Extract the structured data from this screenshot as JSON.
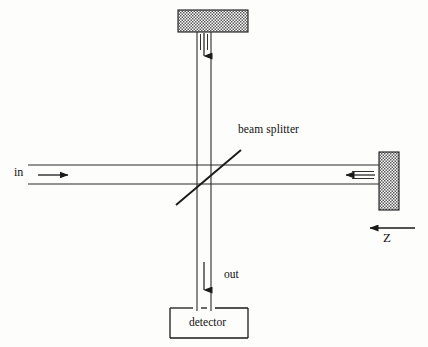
{
  "figure": {
    "background_color": "#fdfdfc",
    "ink_color": "#1a1a1a"
  },
  "labels": {
    "beam_splitter": "beam splitter",
    "input": "in",
    "output": "out",
    "detector": "detector",
    "translation_axis": "Z"
  },
  "components": {
    "top_mirror": {
      "name": "top mirror",
      "fill": "hatch-checker",
      "x": 178,
      "y": 10,
      "width": 70,
      "height": 22
    },
    "right_mirror": {
      "name": "right mirror",
      "fill": "hatch-checker",
      "x": 379,
      "y": 152,
      "width": 20,
      "height": 58
    },
    "beam_splitter_line": {
      "name": "beam splitter",
      "x1": 176,
      "y1": 205,
      "x2": 241,
      "y2": 150
    },
    "detector_box": {
      "name": "detector",
      "x": 170,
      "y": 308,
      "width": 78,
      "height": 30
    }
  },
  "beams": {
    "vertical_left_x": 197,
    "vertical_right_x": 211,
    "horizontal_top_y": 165,
    "horizontal_bottom_y": 184,
    "horizontal_start_x": 28,
    "horizontal_end_x": 379,
    "vertical_top_y": 32,
    "vertical_bottom_y": 311
  },
  "arrows": {
    "top_down_arrow": {
      "name": "downward beam arrow at top mirror",
      "direction": "down",
      "x": 204,
      "y_start": 33,
      "y_end": 59
    },
    "input_arrow": {
      "name": "input beam arrow",
      "direction": "right",
      "y": 175,
      "x_start": 38,
      "x_end": 72
    },
    "right_mirror_arrow": {
      "name": "returning beam arrow at right mirror",
      "direction": "left",
      "y": 175,
      "x_start": 375,
      "x_end": 342
    },
    "output_arrow": {
      "name": "output beam arrow to detector",
      "direction": "down",
      "x": 204,
      "y_start": 262,
      "y_end": 293
    },
    "z_arrow": {
      "name": "Z translation direction arrow",
      "direction": "left",
      "y": 228,
      "x_start": 415,
      "x_end": 366
    }
  }
}
